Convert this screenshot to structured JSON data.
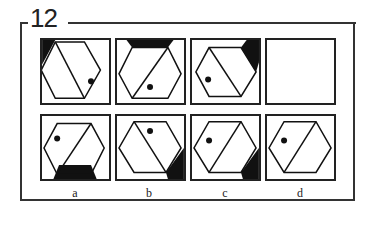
{
  "puzzle": {
    "number": "12",
    "question_row": [
      {
        "id": "q1",
        "shaded_corner": "top-left",
        "dot": "lower-right",
        "diagonal": "tl-br"
      },
      {
        "id": "q2",
        "shaded_corner": "top",
        "dot": "lower-center",
        "diagonal": "bl-tr"
      },
      {
        "id": "q3",
        "shaded_corner": "top-right",
        "dot": "left",
        "diagonal": "tl-br"
      },
      {
        "id": "q4",
        "shaded_corner": "none",
        "dot": "none",
        "diagonal": "none",
        "blank": true
      }
    ],
    "options": [
      {
        "label": "a",
        "shaded_corner": "bottom",
        "dot": "upper-left",
        "diagonal": "bl-tr"
      },
      {
        "label": "b",
        "shaded_corner": "bottom-right",
        "dot": "top",
        "diagonal": "tl-br"
      },
      {
        "label": "c",
        "shaded_corner": "bottom-right",
        "dot": "upper-left",
        "diagonal": "bl-tr"
      },
      {
        "label": "d",
        "shaded_corner": "none",
        "dot": "upper-left",
        "diagonal": "bl-tr"
      }
    ]
  },
  "colors": {
    "ink": "#222222",
    "paper": "#ffffff"
  }
}
